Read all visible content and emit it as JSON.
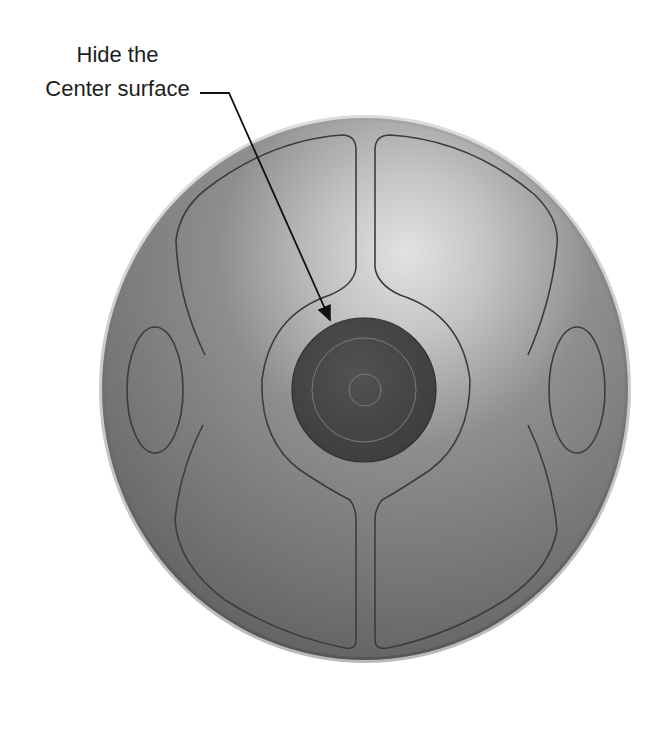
{
  "figure": {
    "callout": {
      "line1": "Hide the",
      "line2": "Center surface",
      "target": "center-surface"
    },
    "colors": {
      "background": "#ffffff",
      "body_base": "#7a7a7a",
      "body_highlight": "#dcdcdc",
      "body_edge": "#555555",
      "outline": "#3c3c3c",
      "center_disc": "#4a4a4a",
      "center_disc_ring": "#7c7c7c",
      "callout_text": "#1e1e1e",
      "arrow": "#111111"
    },
    "parts": [
      "outer-sphere",
      "top-channel",
      "bottom-channel",
      "center-ring",
      "center-surface",
      "left-ellipse",
      "right-ellipse",
      "upper-left-panel",
      "upper-right-panel",
      "lower-left-panel",
      "lower-right-panel"
    ]
  }
}
